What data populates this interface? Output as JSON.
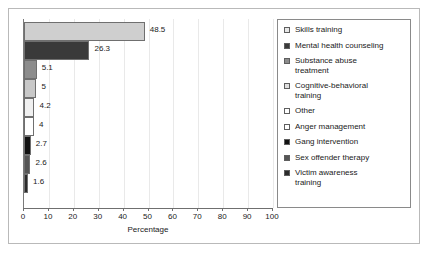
{
  "chart_data": {
    "type": "bar",
    "orientation": "horizontal",
    "title": "",
    "xlabel": "Percentage",
    "ylabel": "",
    "xlim": [
      0,
      100
    ],
    "xticks": [
      0,
      10,
      20,
      30,
      40,
      50,
      60,
      70,
      80,
      90,
      100
    ],
    "grid": true,
    "legend_position": "right",
    "categories": [
      "Skills training",
      "Mental health counseling",
      "Substance abuse treatment",
      "Cognitive-behavioral training",
      "Other",
      "Anger management",
      "Gang intervention",
      "Sex offender therapy",
      "Victim awareness training"
    ],
    "values": [
      48.5,
      26.3,
      5.1,
      5,
      4.2,
      4,
      2.7,
      2.6,
      1.6
    ],
    "value_labels": [
      "48.5",
      "26.3",
      "5.1",
      "5",
      "4.2",
      "4",
      "2.7",
      "2.6",
      "1.6"
    ],
    "colors": [
      "#cfcfcf",
      "#3a3a3a",
      "#8c8c8c",
      "#c8c8c8",
      "#f0f0f0",
      "#ffffff",
      "#111111",
      "#555555",
      "#2b2b2b"
    ]
  },
  "legend": {
    "items": [
      {
        "label": "Skills training",
        "color": "#e8e8e8"
      },
      {
        "label": "Mental health counseling",
        "color": "#3a3a3a"
      },
      {
        "label": "Substance abuse\ntreatment",
        "color": "#8c8c8c"
      },
      {
        "label": "Cognitive-behavioral\ntraining",
        "color": "#e0e0e0"
      },
      {
        "label": "Other",
        "color": "#ffffff"
      },
      {
        "label": "Anger management",
        "color": "#ffffff"
      },
      {
        "label": "Gang intervention",
        "color": "#111111"
      },
      {
        "label": "Sex offender therapy",
        "color": "#555555"
      },
      {
        "label": "Victim awareness\ntraining",
        "color": "#2b2b2b"
      }
    ]
  }
}
